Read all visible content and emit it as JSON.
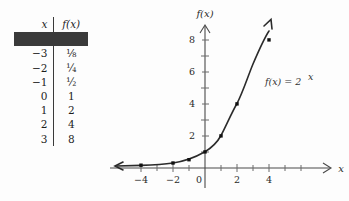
{
  "figure": {
    "background": "#fdfdfd",
    "ink": "#2b2b2b"
  },
  "table": {
    "headers": {
      "x": "x",
      "fx": "f(x)"
    },
    "rows": [
      {
        "x": "−3",
        "fx": "⅛"
      },
      {
        "x": "−2",
        "fx": "¼"
      },
      {
        "x": "−1",
        "fx": "½"
      },
      {
        "x": "0",
        "fx": "1"
      },
      {
        "x": "1",
        "fx": "2"
      },
      {
        "x": "2",
        "fx": "4"
      },
      {
        "x": "3",
        "fx": "8"
      }
    ]
  },
  "graph": {
    "y_axis_title": "f(x)",
    "x_axis_title": "x",
    "function_label": "f(x) = 2",
    "function_exponent": "x",
    "x_ticks": [
      "−4",
      "−2",
      "0",
      "2",
      "4"
    ],
    "y_ticks": [
      "2",
      "4",
      "6",
      "8"
    ]
  },
  "chart_data": {
    "type": "line",
    "title": "",
    "xlabel": "x",
    "ylabel": "f(x)",
    "annotations": [
      "f(x) = 2^x"
    ],
    "xlim": [
      -4.3,
      4.8
    ],
    "ylim": [
      -0.6,
      9.2
    ],
    "grid": false,
    "legend": "none",
    "x_tick_values": [
      -4,
      -2,
      0,
      2,
      4
    ],
    "x_minor_tick_values": [
      -3,
      -1,
      1,
      3
    ],
    "y_tick_values": [
      2,
      4,
      6,
      8
    ],
    "series": [
      {
        "name": "f(x) = 2^x",
        "marker": "square",
        "x": [
          -3,
          -2,
          -1,
          0,
          1,
          2,
          3
        ],
        "values": [
          0.125,
          0.25,
          0.5,
          1,
          2,
          4,
          8
        ]
      }
    ],
    "curve_arrows": [
      "left-asymptote",
      "upper-right"
    ]
  }
}
